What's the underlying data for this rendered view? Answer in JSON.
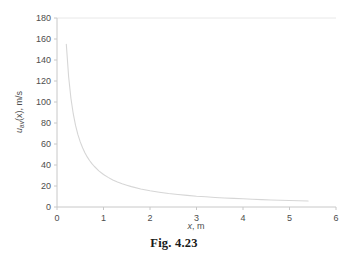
{
  "figure": {
    "caption": "Fig. 4.23"
  },
  "chart_data": {
    "type": "line",
    "title": "",
    "xlabel": "x, m",
    "ylabel": "u_av(x), m/s",
    "ylabel_parts": {
      "symbol": "u",
      "subscript": "av",
      "argument": "(x)",
      "unit": ", m/s"
    },
    "xlabel_parts": {
      "symbol": "x",
      "unit": ", m"
    },
    "xlim": [
      0,
      6
    ],
    "ylim": [
      0,
      180
    ],
    "xticks": [
      0,
      1,
      2,
      3,
      4,
      5,
      6
    ],
    "yticks": [
      0,
      20,
      40,
      60,
      80,
      100,
      120,
      140,
      160,
      180
    ],
    "xtick_labels": [
      "0",
      "1",
      "2",
      "3",
      "4",
      "5",
      "6"
    ],
    "ytick_labels": [
      "0",
      "20",
      "40",
      "60",
      "80",
      "100",
      "120",
      "140",
      "160",
      "180"
    ],
    "grid": false,
    "legend": "none",
    "series": [
      {
        "name": "u_av(x)",
        "color": "#d6d6d6",
        "x": [
          0.2,
          0.25,
          0.3,
          0.35,
          0.4,
          0.45,
          0.5,
          0.55,
          0.6,
          0.65,
          0.7,
          0.75,
          0.8,
          0.9,
          1.0,
          1.1,
          1.2,
          1.3,
          1.4,
          1.5,
          1.6,
          1.8,
          2.0,
          2.2,
          2.4,
          2.6,
          2.8,
          3.0,
          3.2,
          3.4,
          3.6,
          3.8,
          4.0,
          4.2,
          4.4,
          4.6,
          4.8,
          5.0,
          5.2,
          5.4
        ],
        "y": [
          155.0,
          124.0,
          103.3,
          88.6,
          77.5,
          68.9,
          62.0,
          56.4,
          51.7,
          47.7,
          44.3,
          41.3,
          38.8,
          34.4,
          31.0,
          28.2,
          25.8,
          23.8,
          22.1,
          20.7,
          19.4,
          17.2,
          15.5,
          14.1,
          12.9,
          11.9,
          11.1,
          10.3,
          9.7,
          9.1,
          8.6,
          8.2,
          7.8,
          7.4,
          7.0,
          6.7,
          6.5,
          6.2,
          6.0,
          5.7
        ]
      }
    ]
  }
}
